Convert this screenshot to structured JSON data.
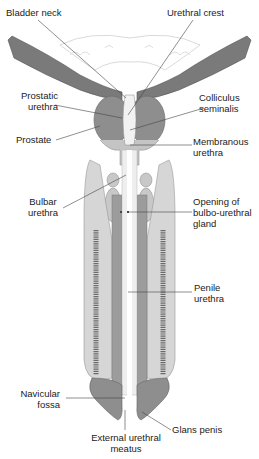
{
  "colors": {
    "dark_tissue": "#7a7a7a",
    "medium_tissue": "#a8a8a8",
    "light_tissue": "#d6d6d6",
    "erectile_pattern": "#6a6a6a",
    "leader_line": "#444444",
    "text": "#222222"
  },
  "labels": {
    "bladder_neck": "Bladder neck",
    "urethral_crest": "Urethral crest",
    "prostatic_urethra_1": "Prostatic",
    "prostatic_urethra_2": "urethra",
    "colliculus_1": "Colliculus",
    "colliculus_2": "seminalis",
    "prostate": "Prostate",
    "membranous_1": "Membranous",
    "membranous_2": "urethra",
    "bulbar_1": "Bulbar",
    "bulbar_2": "urethra",
    "opening_1": "Opening of",
    "opening_2": "bulbo-urethral",
    "opening_3": "gland",
    "penile_1": "Penile",
    "penile_2": "urethra",
    "navicular_1": "Navicular",
    "navicular_2": "fossa",
    "external_1": "External urethral",
    "external_2": "meatus",
    "glans": "Glans penis"
  }
}
